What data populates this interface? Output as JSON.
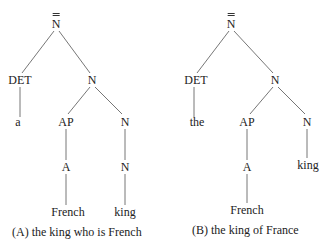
{
  "diagram": {
    "type": "syntax-trees",
    "trees": [
      {
        "id": "A",
        "caption": "(A) the king who is French",
        "nodes": {
          "root": "N",
          "det": "DET",
          "nbar": "N",
          "det_word": "a",
          "ap": "AP",
          "n1": "N",
          "a": "A",
          "n2": "N",
          "adj_word": "French",
          "noun_word": "king"
        },
        "root_bar_level": "double-bar"
      },
      {
        "id": "B",
        "caption": "(B) the king of France",
        "nodes": {
          "root": "N",
          "det": "DET",
          "nbar": "N",
          "det_word": "the",
          "ap": "AP",
          "n1": "N",
          "a": "A",
          "adj_word": "French",
          "noun_word": "king"
        },
        "root_bar_level": "double-bar"
      }
    ]
  }
}
